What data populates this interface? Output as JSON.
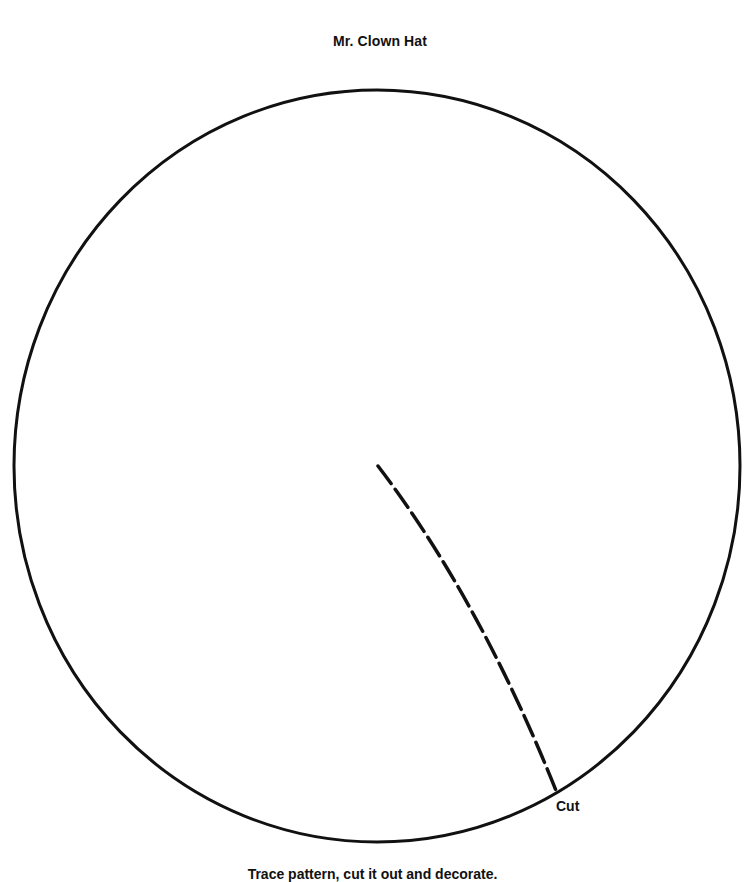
{
  "title": "Mr. Clown Hat",
  "pattern": {
    "shape": "circle",
    "cut_label": "Cut",
    "line_color": "#111111"
  },
  "instructions": "Trace pattern, cut it out and decorate."
}
